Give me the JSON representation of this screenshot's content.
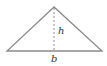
{
  "diagram": {
    "type": "triangle-area",
    "colors": {
      "stroke": "#8a8a8a",
      "text": "#333333"
    },
    "vertices": {
      "apex": [
        54,
        7
      ],
      "left": [
        7,
        51
      ],
      "right": [
        102,
        51
      ]
    },
    "height_line": {
      "from": [
        54,
        7
      ],
      "to": [
        54,
        51
      ],
      "style": "dashed"
    },
    "labels": {
      "height": "h",
      "base": "b"
    }
  }
}
